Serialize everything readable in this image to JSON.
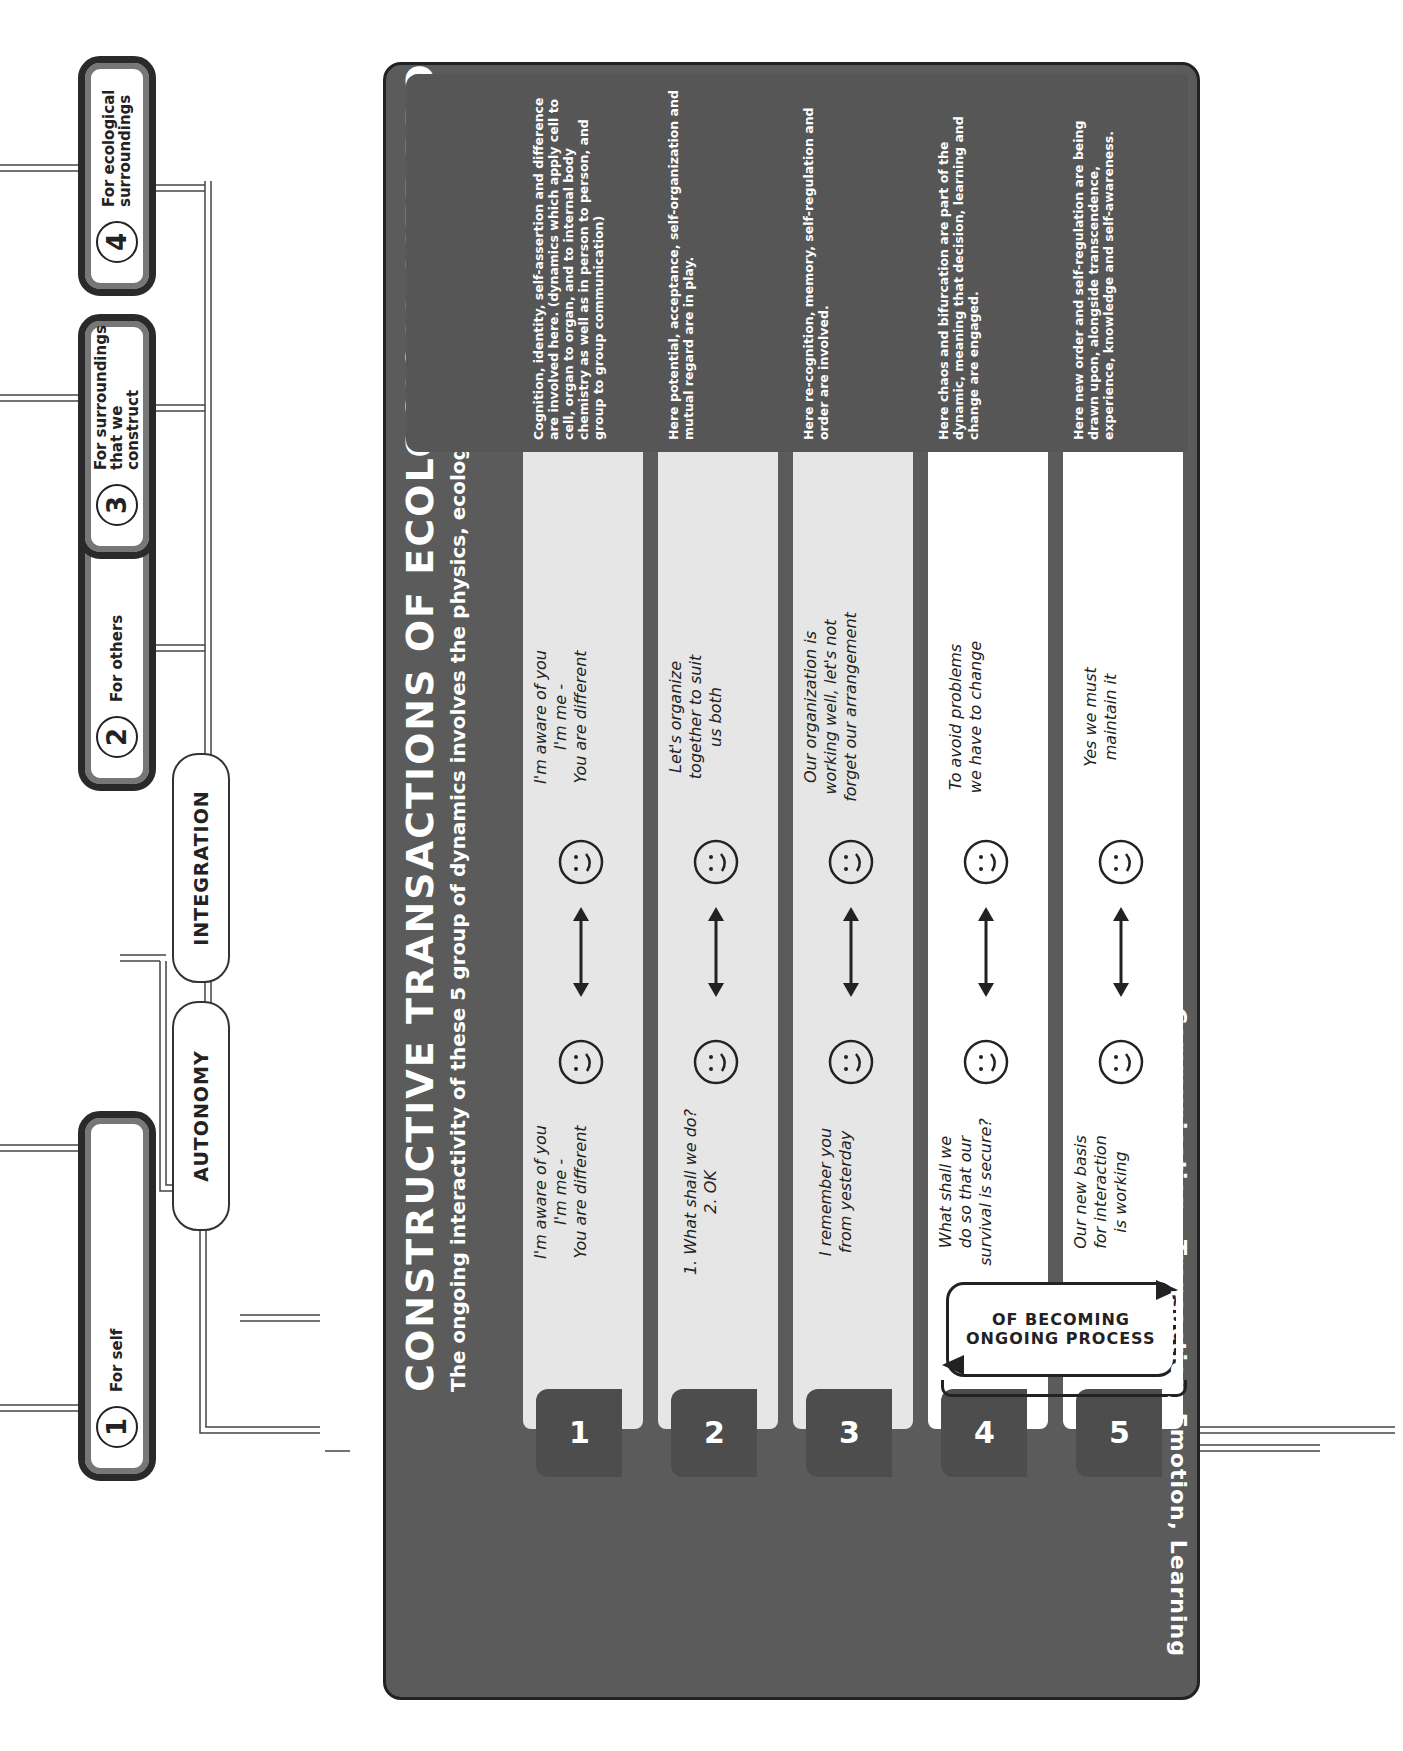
{
  "top_boxes": [
    {
      "num": "1",
      "label": "For self"
    },
    {
      "num": "2",
      "label": "For others"
    },
    {
      "num": "3",
      "label": "For surroundings that we construct",
      "label_line1": "For surroundings",
      "label_line2": "that we construct"
    },
    {
      "num": "4",
      "label": "For ecological surroundings",
      "label_line1": "For ecological",
      "label_line2": "surroundings"
    }
  ],
  "pills": {
    "autonomy": "AUTONOMY",
    "integration": "INTEGRATION"
  },
  "panel": {
    "title": "CONSTRUCTIVE TRANSACTIONS OF ECOLOGICAL LIFE PROCESS",
    "subtitle": "The ongoing interactivity of these 5 group of dynamics involves the physics, ecology and biology of life.",
    "see_appendices": "(See appendices)",
    "side_label": "Communication , Transaction, Emotion, Learning",
    "ongoing_box": {
      "line1": "ONGOING PROCESS",
      "line2": "OF BECOMING"
    },
    "rows": [
      {
        "tab": "1",
        "shade": "grey",
        "left_text": [
          "I'm aware of you",
          "I'm me -",
          "You are different"
        ],
        "right_text": [
          "I'm aware of you",
          "I'm me -",
          "You are different"
        ],
        "note": "Cognition, identity, self-assertion and difference are involved here. (dynamics which apply cell to cell, organ to organ, and to internal body chemistry as well as in person to person, and group to group communication)"
      },
      {
        "tab": "2",
        "shade": "grey",
        "left_text": [
          "1. What shall we do?",
          "2. OK"
        ],
        "right_text": [
          "Let's organize",
          "together to suit",
          "us both"
        ],
        "note": "Here potential, acceptance, self-organization and mutual regard are in play."
      },
      {
        "tab": "3",
        "shade": "grey",
        "left_text": [
          "I remember you",
          "from yesterday"
        ],
        "right_text": [
          "Our organization is",
          "working well, let's not",
          "forget our arrangement"
        ],
        "note": "Here re-cognition, memory, self-regulation and order are involved."
      },
      {
        "tab": "4",
        "shade": "white",
        "left_text": [
          "What shall we",
          "do so that our",
          "survival is secure?"
        ],
        "right_text": [
          "To avoid problems",
          "we have to change"
        ],
        "note": "Here chaos and bifurcation are part of the dynamic, meaning that decision, learning and change are engaged."
      },
      {
        "tab": "5",
        "shade": "white",
        "left_text": [
          "Our new basis",
          "for interaction",
          "is working"
        ],
        "right_text": [
          "Yes we must",
          "maintain it"
        ],
        "note": "Here new order and self-regulation are being drawn upon, alongside transcendence, experience, knowledge and self-awareness."
      }
    ]
  },
  "icons": {
    "face": "smiley-face-icon",
    "double_arrow": "double-arrow-icon",
    "loop_arrow": "loop-arrow-icon"
  },
  "colors": {
    "panel": "#5b5b5b",
    "note": "#565656",
    "row_grey": "#e6e6e6",
    "tab": "#4d4d4d",
    "ink": "#222222"
  }
}
